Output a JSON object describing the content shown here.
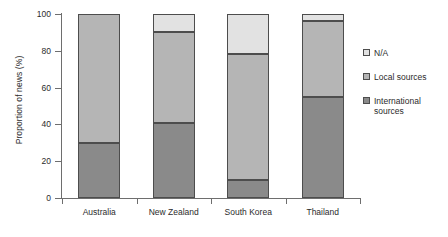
{
  "chart_data": {
    "type": "bar",
    "stacked": true,
    "title": "",
    "xlabel": "",
    "ylabel": "Proportion of news (%)",
    "ylim": [
      0,
      100
    ],
    "yticks": [
      0,
      20,
      40,
      60,
      80,
      100
    ],
    "grid": false,
    "legend_position": "right",
    "categories": [
      "Australia",
      "New Zealand",
      "South Korea",
      "Thailand"
    ],
    "series": [
      {
        "name": "International sources",
        "color": "#8a8a8a",
        "values": [
          30,
          41,
          10,
          55
        ]
      },
      {
        "name": "Local sources",
        "color": "#b5b5b5",
        "values": [
          70,
          49,
          68,
          41
        ]
      },
      {
        "name": "N/A",
        "color": "#e2e2e2",
        "values": [
          0,
          10,
          22,
          4
        ]
      }
    ]
  },
  "axis": {
    "y_title": "Proportion of news (%)",
    "y_tick_labels": [
      "100",
      "80",
      "60",
      "40",
      "20",
      "0"
    ],
    "x_tick_labels": [
      "Australia",
      "New Zealand",
      "South Korea",
      "Thailand"
    ]
  },
  "legend": {
    "items": [
      {
        "label": "N/A",
        "swatch": "#e2e2e2"
      },
      {
        "label": "Local sources",
        "swatch": "#b5b5b5"
      },
      {
        "label": "International sources",
        "swatch": "#8a8a8a"
      }
    ]
  }
}
